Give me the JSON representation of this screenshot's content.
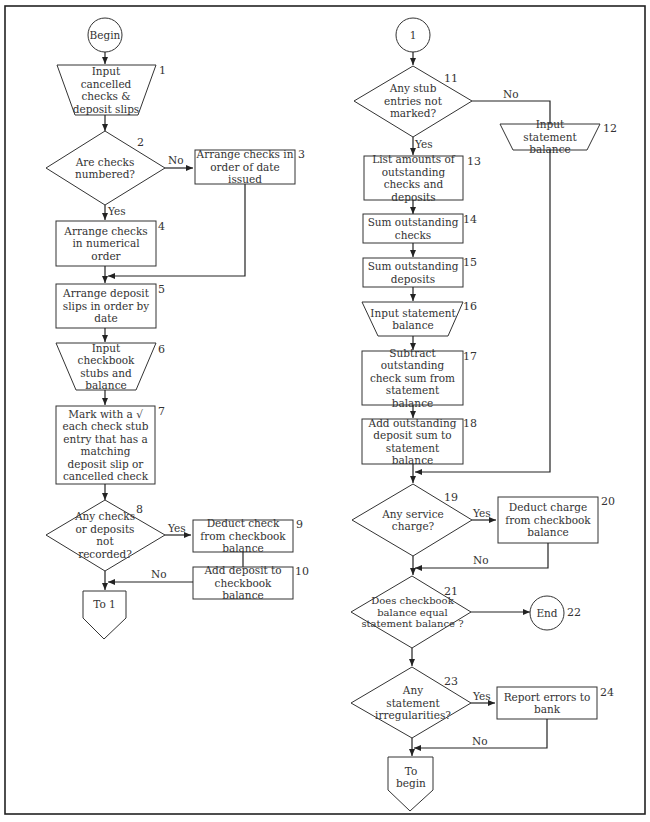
{
  "diagram": {
    "type": "flowchart",
    "title_visible": false,
    "nodes": [
      {
        "id": "begin",
        "shape": "terminal-circle",
        "label": "Begin"
      },
      {
        "id": "1",
        "shape": "manual-input",
        "label": "Input cancelled\nchecks &\ndeposit slips"
      },
      {
        "id": "2",
        "shape": "decision",
        "label": "Are checks\nnumbered?"
      },
      {
        "id": "3",
        "shape": "process",
        "label": "Arrange checks in\norder of date issued"
      },
      {
        "id": "4",
        "shape": "process",
        "label": "Arrange checks in\nnumerical\norder"
      },
      {
        "id": "5",
        "shape": "process",
        "label": "Arrange deposit\nslips in\norder by date"
      },
      {
        "id": "6",
        "shape": "manual-input",
        "label": "Input checkbook\nstubs and\nbalance"
      },
      {
        "id": "7",
        "shape": "process",
        "label": "Mark with a √\neach check stub\nentry that has a\nmatching deposit\nslip or cancelled\ncheck"
      },
      {
        "id": "8",
        "shape": "decision",
        "label": "Any\nchecks or\ndeposits not\nrecorded?"
      },
      {
        "id": "9",
        "shape": "process",
        "label": "Deduct check from\ncheckbook balance"
      },
      {
        "id": "10",
        "shape": "process",
        "label": "Add deposit to\ncheckbook balance"
      },
      {
        "id": "to1",
        "shape": "offpage-connector",
        "label": "To 1"
      },
      {
        "id": "c1",
        "shape": "connector-circle",
        "label": "1"
      },
      {
        "id": "11",
        "shape": "decision",
        "label": "Any\nstub entries\nnot marked?"
      },
      {
        "id": "12",
        "shape": "manual-input",
        "label": "Input statement\nbalance"
      },
      {
        "id": "13",
        "shape": "process",
        "label": "List amounts of\noutstanding checks\nand deposits"
      },
      {
        "id": "14",
        "shape": "process",
        "label": "Sum outstanding\nchecks"
      },
      {
        "id": "15",
        "shape": "process",
        "label": "Sum outstanding\ndeposits"
      },
      {
        "id": "16",
        "shape": "manual-input",
        "label": "Input statement\nbalance"
      },
      {
        "id": "17",
        "shape": "process",
        "label": "Subtract\noutstanding\ncheck sum from\nstatement balance"
      },
      {
        "id": "18",
        "shape": "process",
        "label": "Add outstanding\ndeposit sum to\nstatement balance"
      },
      {
        "id": "19",
        "shape": "decision",
        "label": "Any\nservice\ncharge?"
      },
      {
        "id": "20",
        "shape": "process",
        "label": "Deduct charge from\ncheckbook\nbalance"
      },
      {
        "id": "21",
        "shape": "decision",
        "label": "Does\ncheckbook\nbalance equal statement\nbalance\n?"
      },
      {
        "id": "22",
        "shape": "terminal-circle",
        "label": "End"
      },
      {
        "id": "23",
        "shape": "decision",
        "label": "Any\nstatement\nirregularities?"
      },
      {
        "id": "24",
        "shape": "process",
        "label": "Report errors\nto bank"
      },
      {
        "id": "tobegin",
        "shape": "offpage-connector",
        "label": "To\nbegin"
      }
    ],
    "edges": [
      {
        "from": "begin",
        "to": "1"
      },
      {
        "from": "1",
        "to": "2"
      },
      {
        "from": "2",
        "to": "3",
        "label": "No"
      },
      {
        "from": "2",
        "to": "4",
        "label": "Yes"
      },
      {
        "from": "3",
        "to": "5"
      },
      {
        "from": "4",
        "to": "5"
      },
      {
        "from": "5",
        "to": "6"
      },
      {
        "from": "6",
        "to": "7"
      },
      {
        "from": "7",
        "to": "8"
      },
      {
        "from": "8",
        "to": "9",
        "label": "Yes"
      },
      {
        "from": "9",
        "to": "10"
      },
      {
        "from": "10",
        "to": "to1",
        "label": "No"
      },
      {
        "from": "8",
        "to": "to1"
      },
      {
        "from": "c1",
        "to": "11"
      },
      {
        "from": "11",
        "to": "12",
        "label": "No"
      },
      {
        "from": "11",
        "to": "13",
        "label": "Yes"
      },
      {
        "from": "13",
        "to": "14"
      },
      {
        "from": "14",
        "to": "15"
      },
      {
        "from": "15",
        "to": "16"
      },
      {
        "from": "16",
        "to": "17"
      },
      {
        "from": "17",
        "to": "18"
      },
      {
        "from": "18",
        "to": "19"
      },
      {
        "from": "12",
        "to": "19"
      },
      {
        "from": "19",
        "to": "20",
        "label": "Yes"
      },
      {
        "from": "20",
        "to": "21",
        "label": "No"
      },
      {
        "from": "19",
        "to": "21"
      },
      {
        "from": "21",
        "to": "22"
      },
      {
        "from": "21",
        "to": "23"
      },
      {
        "from": "23",
        "to": "24",
        "label": "Yes"
      },
      {
        "from": "24",
        "to": "tobegin",
        "label": "No"
      },
      {
        "from": "23",
        "to": "tobegin"
      }
    ]
  },
  "labels": {
    "begin": "Begin",
    "n1": "Input cancelled checks & deposit slips",
    "n2": "Are checks numbered?",
    "n3": "Arrange checks in order of date issued",
    "n4": "Arrange checks in numerical order",
    "n5": "Arrange deposit slips in order by date",
    "n6": "Input checkbook stubs and balance",
    "n7": "Mark with a √ each check stub entry that has a matching deposit slip or cancelled check",
    "n8": "Any checks or deposits not recorded?",
    "n9": "Deduct check from checkbook balance",
    "n10": "Add deposit to checkbook balance",
    "to1": "To 1",
    "c1": "1",
    "n11": "Any stub entries not marked?",
    "n12": "Input statement balance",
    "n13": "List amounts of outstanding checks and deposits",
    "n14": "Sum outstanding checks",
    "n15": "Sum outstanding deposits",
    "n16": "Input statement balance",
    "n17": "Subtract outstanding check sum from statement balance",
    "n18": "Add outstanding deposit sum to statement balance",
    "n19": "Any service charge?",
    "n20": "Deduct charge from checkbook balance",
    "n21": "Does checkbook balance equal statement balance ?",
    "n22": "End",
    "n23": "Any statement irregularities?",
    "n24": "Report errors to bank",
    "tobegin": "To begin"
  },
  "numbers": {
    "n1": "1",
    "n2": "2",
    "n3": "3",
    "n4": "4",
    "n5": "5",
    "n6": "6",
    "n7": "7",
    "n8": "8",
    "n9": "9",
    "n10": "10",
    "n11": "11",
    "n12": "12",
    "n13": "13",
    "n14": "14",
    "n15": "15",
    "n16": "16",
    "n17": "17",
    "n18": "18",
    "n19": "19",
    "n20": "20",
    "n21": "21",
    "n22": "22",
    "n23": "23",
    "n24": "24"
  },
  "edge_labels": {
    "yes": "Yes",
    "no": "No"
  },
  "colors": {
    "stroke": "#222222",
    "background": "#ffffff",
    "text": "#333333"
  }
}
